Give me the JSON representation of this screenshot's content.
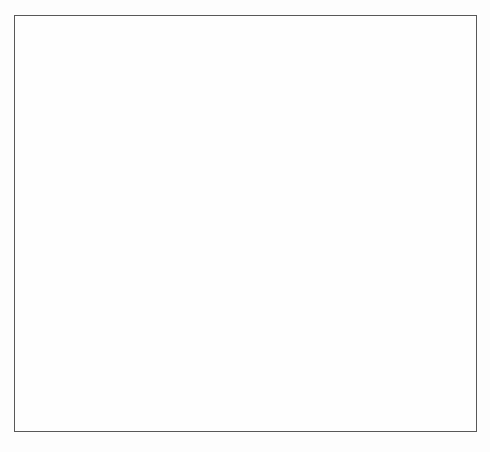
{
  "figure": {
    "border_color": "#585858",
    "background_color": "#fefefe"
  },
  "compartments": [
    {
      "id": "bm",
      "label": "BM",
      "label_x": 134,
      "label_y": 47,
      "size": "lg",
      "description": "bone marrow tissue blob",
      "fill": "#e3e3e3"
    },
    {
      "id": "thymus",
      "label": "Thymus",
      "label_x": 38,
      "label_y": 289,
      "size": "md",
      "description": "thymus oval blob",
      "fill": "#ededed"
    },
    {
      "id": "pb",
      "label": "PB",
      "label_x": 188,
      "label_y": 313,
      "size": "lg",
      "description": "peripheral blood vessel lumen",
      "fill": "#8a8a8a"
    }
  ],
  "cells": [
    {
      "id": "hsc1",
      "label": "HSC",
      "cx": 106,
      "cy": 66,
      "r": 15,
      "label_x": 77,
      "label_y": 82,
      "anchor": "right"
    },
    {
      "id": "hsc2",
      "label": "HSC",
      "cx": 121,
      "cy": 119,
      "r": 15.5,
      "label_x": 97,
      "label_y": 140,
      "anchor": "right"
    },
    {
      "id": "mpp",
      "label": "MPP",
      "cx": 147,
      "cy": 165,
      "r": 15.5,
      "label_x": 122,
      "label_y": 190,
      "anchor": "right"
    },
    {
      "id": "cmp",
      "label": "CMP",
      "cx": 186,
      "cy": 112,
      "r": 15.5,
      "label_x": 159,
      "label_y": 136,
      "anchor": "right"
    },
    {
      "id": "mye",
      "label": "Myeloid",
      "cx": 0,
      "cy": 0,
      "r": 0,
      "label_x": 205,
      "label_y": 136,
      "anchor": "text"
    },
    {
      "id": "mlp",
      "label": "MLP",
      "cx": 179,
      "cy": 210,
      "r": 15.5,
      "label_x": 156,
      "label_y": 236,
      "anchor": "right"
    },
    {
      "id": "bnk",
      "label": "B/NK",
      "cx": 245,
      "cy": 209,
      "r": 15.5,
      "label_x": 223,
      "label_y": 235,
      "anchor": "right"
    },
    {
      "id": "nkp",
      "label": "NKP",
      "cx": 307,
      "cy": 178,
      "r": 15.5,
      "label_x": 284,
      "label_y": 197,
      "anchor": "right"
    },
    {
      "id": "bp",
      "label": "BP",
      "cx": 324,
      "cy": 220,
      "r": 15.5,
      "label_x": 308,
      "label_y": 243,
      "anchor": "right"
    },
    {
      "id": "nk",
      "label": "NK",
      "cx": 380,
      "cy": 185,
      "r": 14.5,
      "label_x": 355,
      "label_y": 208,
      "anchor": "right"
    },
    {
      "id": "b",
      "label": "B",
      "cx": 387,
      "cy": 226,
      "r": 14.5,
      "label_x": 369,
      "label_y": 248,
      "anchor": "right"
    },
    {
      "id": "tp",
      "label": "TP",
      "cx": 71,
      "cy": 330,
      "r": 14.5,
      "label_x": 53,
      "label_y": 356,
      "anchor": "right"
    },
    {
      "id": "t",
      "label": "T",
      "cx": 86,
      "cy": 378,
      "r": 14.5,
      "label_x": 77,
      "label_y": 403,
      "anchor": "right"
    }
  ],
  "arrows": {
    "solid": [
      {
        "from": "hsc2",
        "to": "hsc1",
        "note": "self-renewal upward"
      },
      {
        "from": "hsc2",
        "to": "mpp",
        "note": "HSC to MPP"
      },
      {
        "from": "mpp",
        "to": "cmp",
        "note": "MPP to CMP"
      },
      {
        "from": "cmp",
        "to": "myeloid",
        "note": "CMP to Myeloid"
      },
      {
        "from": "mlp",
        "to": "bnk",
        "note": "MLP to B/NK"
      },
      {
        "from": "bnk",
        "to": "nkp",
        "note": "B/NK to NKP"
      },
      {
        "from": "bnk",
        "to": "bp",
        "note": "B/NK to BP"
      },
      {
        "from": "nkp",
        "to": "nk",
        "note": "NKP to NK"
      },
      {
        "from": "bp",
        "to": "b",
        "note": "BP to B"
      },
      {
        "from": "tp",
        "to": "t",
        "note": "TP to T"
      },
      {
        "from": "t",
        "to": "pb",
        "note": "T cell enters peripheral blood"
      },
      {
        "from": "b_nk_group",
        "to": "pb_right",
        "note": "NK and B cells enter blood via right connector"
      }
    ],
    "dashed": [
      {
        "from": "hsc2",
        "to": "pb_left",
        "note": "HSC migrates into blood"
      },
      {
        "from": "mpp",
        "to": "mlp",
        "note": "MPP to MLP (dashed)"
      },
      {
        "from": "mlp",
        "to": "pb_mid",
        "note": "MLP migrates into blood"
      },
      {
        "from": "pb",
        "to": "tp",
        "note": "progenitor from blood seeds thymus"
      }
    ]
  },
  "blood_contents": [
    {
      "id": "hsc-in-blood",
      "name": "hsc-in-blood-cell",
      "cx": 154,
      "cy": 336,
      "r": 13
    },
    {
      "id": "mlp-in-blood",
      "name": "mlp-in-blood-cell",
      "cx": 166,
      "cy": 378,
      "r": 13
    },
    {
      "id": "granulocyte1",
      "name": "granulocyte-cell",
      "cx": 222,
      "cy": 330,
      "r": 13
    },
    {
      "id": "granulocyte2",
      "name": "granulocyte-cell",
      "cx": 225,
      "cy": 376,
      "r": 13
    },
    {
      "id": "monocyte",
      "name": "monocyte-cell",
      "cx": 272,
      "cy": 376,
      "r": 15
    },
    {
      "id": "eosinophil",
      "name": "eosinophil-cell",
      "cx": 287,
      "cy": 335,
      "r": 21
    },
    {
      "id": "lymphocyte1",
      "name": "lymphocyte-cell",
      "cx": 322,
      "cy": 374,
      "r": 17
    },
    {
      "id": "platelet-star",
      "name": "platelet-star-cell",
      "cx": 333,
      "cy": 333,
      "r": 16
    },
    {
      "id": "nk-cluster",
      "name": "nk-cell-cluster",
      "cx": 378,
      "cy": 331,
      "r": 9
    },
    {
      "id": "lymphocyte2",
      "name": "lymphocyte-cell",
      "cx": 403,
      "cy": 374,
      "r": 17
    },
    {
      "id": "platelets",
      "name": "platelet-group",
      "cx": 348,
      "cy": 365,
      "r": 5
    }
  ],
  "vessel": {
    "x": 125,
    "y": 292,
    "width": 300,
    "height": 103,
    "endothelial_count": 8,
    "lumen_color": "#8a8a8a",
    "wall_color": "#f2f2f2",
    "nucleus_color": "#2b2b2b"
  },
  "palette": {
    "cell_ring": "#6e6e6e",
    "cell_ring_dark": "#4f4f4f",
    "cell_core": "#c9c9c9",
    "arrow": "#121212",
    "text": "#1b1b1b",
    "bm_blob": "#e6e6e6",
    "thymus_blob": "#ededed"
  }
}
